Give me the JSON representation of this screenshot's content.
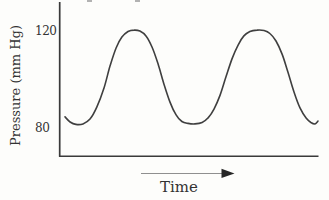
{
  "chart": {
    "y_axis": {
      "title": "Pressure (mm Hg)",
      "ticks": [
        {
          "label": "120",
          "value": 120
        },
        {
          "label": "80",
          "value": 80
        }
      ]
    },
    "x_axis": {
      "title": "Time",
      "tick_labels": [],
      "arrow_direction": "right"
    }
  },
  "colors": {
    "curve": "#3f3f3f",
    "axis": "#3a3a3a",
    "text": "#333333",
    "arrow_line": "#8f8f8f",
    "arrow_head": "#262626",
    "background": "#fdfdfb"
  },
  "chart_data": {
    "type": "line",
    "title": "",
    "xlabel": "Time",
    "ylabel": "Pressure (mm Hg)",
    "yticks": [
      80,
      120
    ],
    "ylim_visible": [
      72,
      132
    ],
    "x_range_normalized": [
      0,
      10
    ],
    "x_axis_unlabeled": true,
    "cycles_shown": 2,
    "peak_mmHg": 121,
    "trough_mmHg": 82,
    "series": [
      {
        "name": "blood-pressure-wave",
        "x": [
          0,
          0.2,
          0.43,
          0.71,
          0.99,
          1.26,
          1.54,
          1.78,
          2.02,
          2.25,
          2.49,
          2.73,
          2.96,
          3.2,
          3.44,
          3.68,
          3.91,
          4.15,
          4.39,
          4.62,
          4.86,
          5.14,
          5.42,
          5.65,
          5.89,
          6.13,
          6.36,
          6.6,
          6.84,
          7.07,
          7.31,
          7.59,
          7.87,
          8.1,
          8.34,
          8.58,
          8.81,
          9.05,
          9.29,
          9.53,
          9.72,
          9.88,
          10
        ],
        "values": [
          85,
          82.9,
          81.9,
          82.1,
          84.1,
          89.1,
          96.9,
          106,
          113.4,
          117.9,
          120.2,
          120.8,
          120.4,
          118.4,
          113.8,
          106.8,
          98.6,
          91.1,
          85.8,
          83.1,
          82.3,
          82.1,
          82.7,
          84.5,
          88.2,
          94,
          101.4,
          108.9,
          114.6,
          118.4,
          120.2,
          120.8,
          120.6,
          119.4,
          116.3,
          110.9,
          103.5,
          95.3,
          88.7,
          84.5,
          82.7,
          82.1,
          83.3
        ]
      }
    ]
  }
}
